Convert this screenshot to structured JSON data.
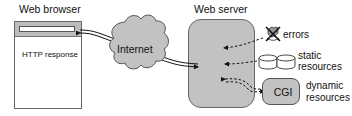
{
  "browser": {
    "title": "Web browser",
    "content_text": "HTTP response"
  },
  "network": {
    "label": "Internet"
  },
  "server": {
    "title": "Web server"
  },
  "resources": [
    {
      "label": "errors",
      "icon": "crossed-out-hand-icon"
    },
    {
      "label": "static",
      "label2": "resources",
      "icon": "database-disks-icon"
    },
    {
      "label": "dynamic",
      "label2": "resources",
      "node": "CGI"
    }
  ],
  "colors": {
    "fill_gray": "#c2c2c2",
    "stroke": "#333333",
    "background": "#ffffff"
  }
}
